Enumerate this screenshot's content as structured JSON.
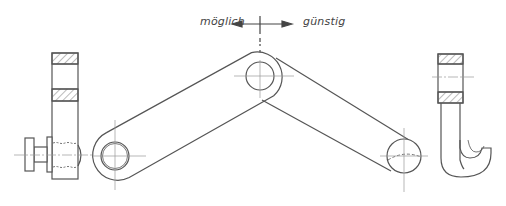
{
  "diagram": {
    "type": "technical-drawing",
    "labels": {
      "left_direction": "möglich",
      "right_direction": "günstig"
    },
    "colors": {
      "line": "#555555",
      "centerline": "#9a9a9a",
      "background": "#ffffff"
    },
    "parts": [
      {
        "name": "side-view-with-knob"
      },
      {
        "name": "left-link-arm"
      },
      {
        "name": "right-link-arm"
      },
      {
        "name": "side-view-with-hook"
      }
    ]
  }
}
